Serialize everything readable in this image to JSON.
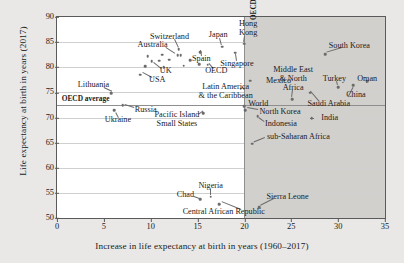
{
  "chart_data": {
    "type": "scatter",
    "title": "",
    "xlabel": "Increase in life expectancy at birth in years (1960–2017)",
    "ylabel": "Life expectancy at birth in years (2017)",
    "xlim": [
      0,
      35
    ],
    "ylim": [
      50,
      90
    ],
    "xticks": [
      0,
      5,
      10,
      15,
      20,
      25,
      30,
      35
    ],
    "yticks": [
      50,
      55,
      60,
      65,
      70,
      75,
      80,
      85,
      90
    ],
    "grid": true,
    "legend": "none",
    "reference_lines": [
      {
        "name": "oecd-average-horizontal",
        "orientation": "horizontal",
        "value": 72.5,
        "label": "OECD average"
      },
      {
        "name": "oecd-average-vertical",
        "orientation": "vertical",
        "value": 20,
        "label": "OECD average"
      }
    ],
    "shaded_region": {
      "x_from": 20,
      "x_to": 35,
      "color": "#d2d0cd"
    },
    "points": [
      {
        "label": "Switzerland",
        "x": 13.0,
        "y": 83.6
      },
      {
        "label": "Japan",
        "x": 17.6,
        "y": 84.1
      },
      {
        "label": "Hong Kong",
        "x": 20.0,
        "y": 84.7
      },
      {
        "label": "Australia",
        "x": 11.2,
        "y": 82.5
      },
      {
        "label": "Spain",
        "x": 15.3,
        "y": 83.0
      },
      {
        "label": "Singapore",
        "x": 19.0,
        "y": 82.9
      },
      {
        "label": "UK",
        "x": 10.1,
        "y": 81.2
      },
      {
        "label": "OECD",
        "x": 16.1,
        "y": 80.5
      },
      {
        "label": "USA",
        "x": 8.9,
        "y": 78.5
      },
      {
        "label": "South Korea",
        "x": 28.6,
        "y": 82.6
      },
      {
        "label": "Mexico",
        "x": 20.6,
        "y": 77.3
      },
      {
        "label": "Latin America & the Caribbean",
        "x": 19.6,
        "y": 75.7
      },
      {
        "label": "Turkey",
        "x": 30.0,
        "y": 76.0
      },
      {
        "label": "Oman",
        "x": 33.1,
        "y": 77.2
      },
      {
        "label": "China",
        "x": 31.6,
        "y": 76.4
      },
      {
        "label": "Middle East & North Africa",
        "x": 25.1,
        "y": 73.6
      },
      {
        "label": "Saudi Arabia",
        "x": 27.0,
        "y": 74.9
      },
      {
        "label": "Lithuania",
        "x": 5.8,
        "y": 74.8
      },
      {
        "label": "Russia",
        "x": 7.0,
        "y": 72.4
      },
      {
        "label": "Ukraine",
        "x": 6.1,
        "y": 71.5
      },
      {
        "label": "World",
        "x": 20.0,
        "y": 72.3
      },
      {
        "label": "North Korea",
        "x": 20.1,
        "y": 71.5
      },
      {
        "label": "Pacific Island Small States",
        "x": 15.6,
        "y": 70.9
      },
      {
        "label": "Indonesia",
        "x": 21.4,
        "y": 70.3
      },
      {
        "label": "India",
        "x": 27.2,
        "y": 69.9
      },
      {
        "label": "sub-Saharan Africa",
        "x": 20.8,
        "y": 64.8
      },
      {
        "label": "Nigeria",
        "x": 16.4,
        "y": 54.2
      },
      {
        "label": "Chad",
        "x": 15.3,
        "y": 53.7
      },
      {
        "label": "Central African Republic",
        "x": 17.3,
        "y": 52.8
      },
      {
        "label": "Sierra Leone",
        "x": 21.6,
        "y": 52.1
      },
      {
        "label": "cluster-eu-1",
        "x": 9.7,
        "y": 82.2
      },
      {
        "label": "cluster-eu-2",
        "x": 10.9,
        "y": 81.3
      },
      {
        "label": "cluster-eu-3",
        "x": 12.0,
        "y": 81.5
      },
      {
        "label": "cluster-eu-4",
        "x": 12.9,
        "y": 82.4
      },
      {
        "label": "cluster-eu-5",
        "x": 13.2,
        "y": 82.4
      },
      {
        "label": "cluster-eu-6",
        "x": 14.2,
        "y": 81.4
      },
      {
        "label": "cluster-eu-7",
        "x": 9.4,
        "y": 80.2
      },
      {
        "label": "cluster-eu-8",
        "x": 11.4,
        "y": 80.0
      },
      {
        "label": "cluster-eu-9",
        "x": 13.5,
        "y": 80.3
      },
      {
        "label": "cluster-eu-10",
        "x": 15.2,
        "y": 80.6
      }
    ],
    "annotations": [
      {
        "text": "Switzerland",
        "x": 12.0,
        "y": 86.1,
        "align": "center"
      },
      {
        "text": "Japan",
        "x": 17.2,
        "y": 86.4,
        "align": "center"
      },
      {
        "text": "Hong",
        "x": 20.4,
        "y": 88.6,
        "align": "center"
      },
      {
        "text": "Kong",
        "x": 20.4,
        "y": 86.8,
        "align": "center"
      },
      {
        "text": "Australia",
        "x": 10.2,
        "y": 84.4,
        "align": "center"
      },
      {
        "text": "Spain",
        "x": 15.4,
        "y": 81.7,
        "align": "center"
      },
      {
        "text": "Singapore",
        "x": 19.2,
        "y": 80.7,
        "align": "center"
      },
      {
        "text": "UK",
        "x": 11.6,
        "y": 79.2,
        "align": "center"
      },
      {
        "text": "OECD",
        "x": 17.0,
        "y": 79.2,
        "align": "center"
      },
      {
        "text": "USA",
        "x": 10.7,
        "y": 77.4,
        "align": "center"
      },
      {
        "text": "South Korea",
        "x": 31.2,
        "y": 84.3,
        "align": "center"
      },
      {
        "text": "Mexico",
        "x": 22.3,
        "y": 77.3,
        "align": "left"
      },
      {
        "text": "Latin America",
        "x": 18.0,
        "y": 76.1,
        "align": "center"
      },
      {
        "text": "& the Caribbean",
        "x": 18.0,
        "y": 74.3,
        "align": "center"
      },
      {
        "text": "Middle East",
        "x": 25.2,
        "y": 79.4,
        "align": "center"
      },
      {
        "text": "& North",
        "x": 25.2,
        "y": 77.6,
        "align": "center"
      },
      {
        "text": "Africa",
        "x": 25.2,
        "y": 75.8,
        "align": "center"
      },
      {
        "text": "Turkey",
        "x": 29.6,
        "y": 77.6,
        "align": "center"
      },
      {
        "text": "Oman",
        "x": 33.1,
        "y": 77.6,
        "align": "center"
      },
      {
        "text": "China",
        "x": 31.9,
        "y": 74.4,
        "align": "center"
      },
      {
        "text": "Saudi Arabia",
        "x": 29.0,
        "y": 72.6,
        "align": "center"
      },
      {
        "text": "Lithuania",
        "x": 3.9,
        "y": 76.4,
        "align": "center"
      },
      {
        "text": "Russia",
        "x": 8.3,
        "y": 71.4,
        "align": "left"
      },
      {
        "text": "Ukraine",
        "x": 6.5,
        "y": 69.6,
        "align": "center"
      },
      {
        "text": "OECD average",
        "x": 0.5,
        "y": 73.6,
        "align": "left"
      },
      {
        "text": "World",
        "x": 20.4,
        "y": 72.6,
        "align": "left"
      },
      {
        "text": "North Korea",
        "x": 21.6,
        "y": 71.1,
        "align": "left"
      },
      {
        "text": "Pacific Island",
        "x": 12.8,
        "y": 70.5,
        "align": "center"
      },
      {
        "text": "Small States",
        "x": 12.8,
        "y": 68.7,
        "align": "center"
      },
      {
        "text": "Indonesia",
        "x": 22.2,
        "y": 68.8,
        "align": "left"
      },
      {
        "text": "India",
        "x": 28.2,
        "y": 69.9,
        "align": "left"
      },
      {
        "text": "sub-Saharan Africa",
        "x": 22.4,
        "y": 66.2,
        "align": "left"
      },
      {
        "text": "Nigeria",
        "x": 16.4,
        "y": 56.3,
        "align": "center"
      },
      {
        "text": "Chad",
        "x": 13.7,
        "y": 54.5,
        "align": "center"
      },
      {
        "text": "Central African Republic",
        "x": 17.8,
        "y": 51.2,
        "align": "center"
      },
      {
        "text": "Sierra Leone",
        "x": 24.6,
        "y": 54.1,
        "align": "center"
      }
    ],
    "leaders": [
      {
        "from": [
          12.6,
          85.6
        ],
        "to": [
          13.0,
          84.0
        ]
      },
      {
        "from": [
          17.4,
          85.9
        ],
        "to": [
          17.6,
          84.5
        ]
      },
      {
        "from": [
          20.1,
          86.3
        ],
        "to": [
          20.0,
          85.1
        ]
      },
      {
        "from": [
          11.6,
          84.0
        ],
        "to": [
          12.6,
          82.8
        ]
      },
      {
        "from": [
          15.4,
          82.2
        ],
        "to": [
          15.3,
          83.3
        ]
      },
      {
        "from": [
          19.1,
          81.2
        ],
        "to": [
          19.0,
          82.5
        ]
      },
      {
        "from": [
          11.1,
          79.6
        ],
        "to": [
          10.3,
          80.8
        ]
      },
      {
        "from": [
          16.6,
          79.7
        ],
        "to": [
          16.1,
          80.8
        ]
      },
      {
        "from": [
          10.1,
          77.9
        ],
        "to": [
          9.1,
          78.9
        ]
      },
      {
        "from": [
          30.4,
          83.9
        ],
        "to": [
          28.8,
          83.0
        ]
      },
      {
        "from": [
          20.0,
          75.4
        ],
        "to": [
          19.7,
          76.0
        ]
      },
      {
        "from": [
          25.2,
          75.4
        ],
        "to": [
          25.1,
          74.0
        ]
      },
      {
        "from": [
          29.9,
          77.2
        ],
        "to": [
          30.0,
          76.4
        ]
      },
      {
        "from": [
          33.1,
          77.2
        ],
        "to": [
          33.1,
          76.8
        ]
      },
      {
        "from": [
          31.0,
          74.2
        ],
        "to": [
          31.5,
          76.0
        ]
      },
      {
        "from": [
          28.0,
          73.0
        ],
        "to": [
          27.0,
          75.2
        ]
      },
      {
        "from": [
          5.0,
          76.0
        ],
        "to": [
          5.9,
          75.2
        ]
      },
      {
        "from": [
          8.2,
          71.8
        ],
        "to": [
          7.2,
          72.4
        ]
      },
      {
        "from": [
          6.5,
          70.0
        ],
        "to": [
          6.2,
          71.1
        ]
      },
      {
        "from": [
          21.5,
          71.4
        ],
        "to": [
          20.3,
          71.8
        ]
      },
      {
        "from": [
          15.0,
          70.6
        ],
        "to": [
          15.5,
          71.3
        ]
      },
      {
        "from": [
          22.1,
          69.2
        ],
        "to": [
          21.5,
          70.0
        ]
      },
      {
        "from": [
          27.0,
          70.0
        ],
        "to": [
          27.4,
          70.0
        ]
      },
      {
        "from": [
          22.2,
          66.0
        ],
        "to": [
          21.0,
          65.1
        ]
      },
      {
        "from": [
          16.4,
          55.8
        ],
        "to": [
          16.4,
          54.6
        ]
      },
      {
        "from": [
          14.6,
          54.4
        ],
        "to": [
          15.2,
          54.0
        ]
      },
      {
        "from": [
          19.6,
          51.5
        ],
        "to": [
          17.5,
          53.1
        ]
      },
      {
        "from": [
          23.2,
          53.7
        ],
        "to": [
          21.8,
          52.4
        ]
      }
    ]
  }
}
